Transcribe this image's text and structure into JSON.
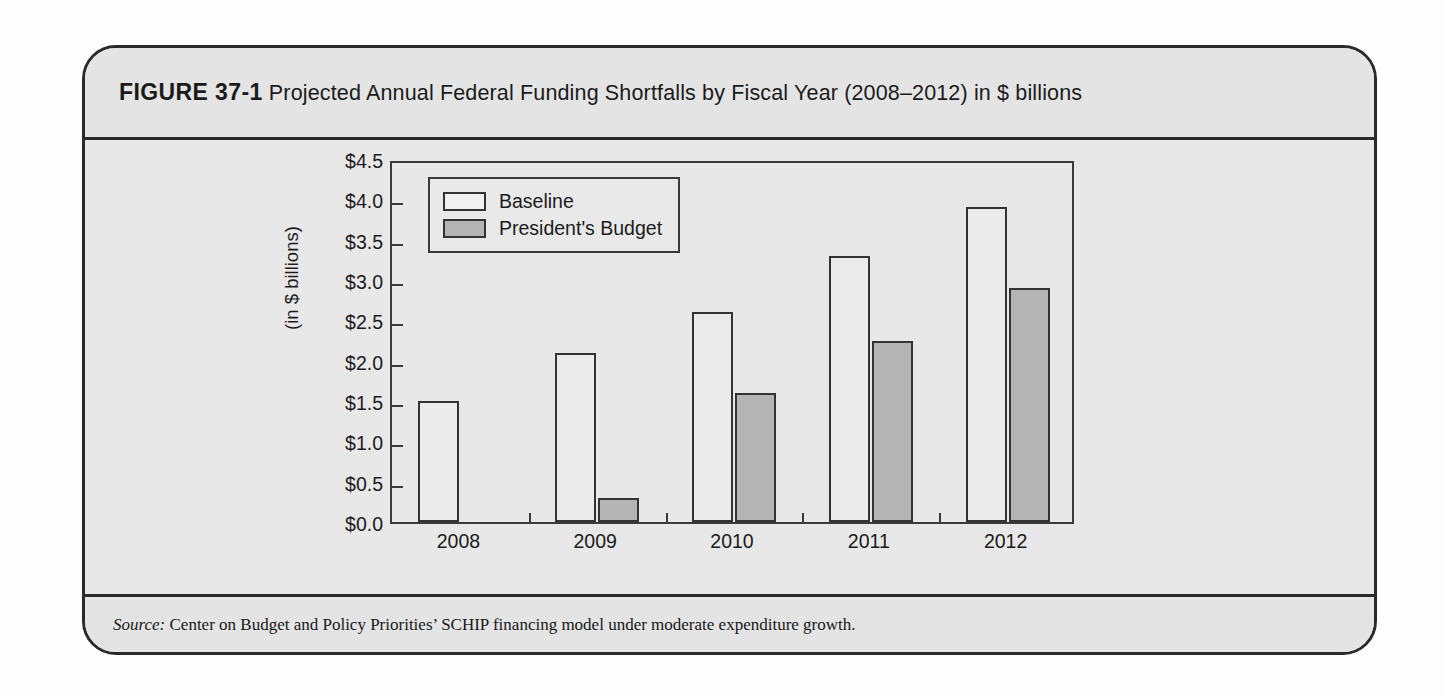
{
  "figure": {
    "label": "FIGURE 37-1",
    "title": "Projected Annual Federal Funding Shortfalls by Fiscal Year (2008–2012) in $ billions",
    "source_label": "Source:",
    "source_text": " Center on Budget and Policy Priorities’ SCHIP financing model under moderate expenditure growth.",
    "frame_border_color": "#2a2a2a",
    "panel_background": "#e6e6e6"
  },
  "chart_data": {
    "type": "bar",
    "title": "Projected Annual Federal Funding Shortfalls by Fiscal Year (2008–2012) in $ billions",
    "xlabel": "",
    "ylabel": "(in $ billions)",
    "categories": [
      "2008",
      "2009",
      "2010",
      "2011",
      "2012"
    ],
    "series": [
      {
        "name": "Baseline",
        "color": "#ebebeb",
        "values": [
          1.5,
          2.1,
          2.6,
          3.3,
          3.9
        ]
      },
      {
        "name": "President's Budget",
        "color": "#b4b4b4",
        "values": [
          0.0,
          0.3,
          1.6,
          2.25,
          2.9
        ]
      }
    ],
    "ylim": [
      0.0,
      4.5
    ],
    "ytick_values": [
      0.0,
      0.5,
      1.0,
      1.5,
      2.0,
      2.5,
      3.0,
      3.5,
      4.0,
      4.5
    ],
    "ytick_labels": [
      "$0.0",
      "$0.5",
      "$1.0",
      "$1.5",
      "$2.0",
      "$2.5",
      "$3.0",
      "$3.5",
      "$4.0",
      "$4.5"
    ],
    "grid": false,
    "legend_position": "top-left",
    "legend_entries": [
      "Baseline",
      "President's Budget"
    ]
  }
}
